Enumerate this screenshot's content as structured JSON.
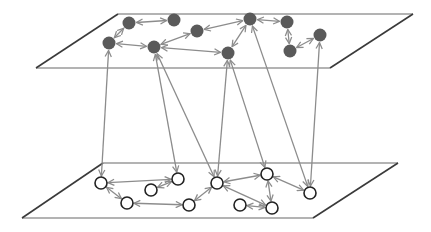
{
  "diagram": {
    "type": "multilayer-network",
    "colors": {
      "plane_edge": "#9a9a9a",
      "plane_diag": "#3a3a3a",
      "edge": "#8c8c8c",
      "top_node_fill": "#5a5a5a",
      "bottom_node_fill": "#ffffff",
      "bottom_node_stroke": "#222222"
    },
    "planes": [
      {
        "id": "top",
        "tl": [
          118,
          14
        ],
        "tr": [
          413,
          14
        ],
        "br": [
          330,
          68
        ],
        "bl": [
          36,
          68
        ]
      },
      {
        "id": "bottom",
        "tl": [
          103,
          163
        ],
        "tr": [
          398,
          163
        ],
        "br": [
          313,
          218
        ],
        "bl": [
          22,
          218
        ]
      }
    ],
    "top_nodes": [
      {
        "id": "T1",
        "x": 129,
        "y": 23
      },
      {
        "id": "T2",
        "x": 174,
        "y": 20
      },
      {
        "id": "T3",
        "x": 197,
        "y": 31
      },
      {
        "id": "T4",
        "x": 250,
        "y": 19
      },
      {
        "id": "T5",
        "x": 287,
        "y": 22
      },
      {
        "id": "T6",
        "x": 320,
        "y": 35
      },
      {
        "id": "T7",
        "x": 109,
        "y": 43
      },
      {
        "id": "T8",
        "x": 154,
        "y": 47
      },
      {
        "id": "T9",
        "x": 228,
        "y": 53
      },
      {
        "id": "T10",
        "x": 290,
        "y": 51
      }
    ],
    "bottom_nodes": [
      {
        "id": "B1",
        "x": 101,
        "y": 183
      },
      {
        "id": "B2",
        "x": 178,
        "y": 179
      },
      {
        "id": "B3",
        "x": 151,
        "y": 190
      },
      {
        "id": "B4",
        "x": 127,
        "y": 203
      },
      {
        "id": "B5",
        "x": 189,
        "y": 205
      },
      {
        "id": "B6",
        "x": 217,
        "y": 183
      },
      {
        "id": "B7",
        "x": 267,
        "y": 174
      },
      {
        "id": "B8",
        "x": 240,
        "y": 205
      },
      {
        "id": "B9",
        "x": 272,
        "y": 208
      },
      {
        "id": "B10",
        "x": 310,
        "y": 193
      }
    ],
    "edges": [
      [
        "T1",
        "T2"
      ],
      [
        "T1",
        "T7"
      ],
      [
        "T7",
        "T8"
      ],
      [
        "T8",
        "T3"
      ],
      [
        "T8",
        "T9"
      ],
      [
        "T3",
        "T4"
      ],
      [
        "T4",
        "T5"
      ],
      [
        "T4",
        "T9"
      ],
      [
        "T5",
        "T10"
      ],
      [
        "T10",
        "T6"
      ],
      [
        "B1",
        "B2"
      ],
      [
        "B1",
        "B4"
      ],
      [
        "B3",
        "B2"
      ],
      [
        "B4",
        "B5"
      ],
      [
        "B5",
        "B6"
      ],
      [
        "B6",
        "B7"
      ],
      [
        "B6",
        "B9"
      ],
      [
        "B7",
        "B9"
      ],
      [
        "B7",
        "B10"
      ],
      [
        "B8",
        "B9"
      ],
      [
        "T7",
        "B1"
      ],
      [
        "T8",
        "B2"
      ],
      [
        "T8",
        "B6"
      ],
      [
        "T9",
        "B6"
      ],
      [
        "T9",
        "B7"
      ],
      [
        "T4",
        "B10"
      ],
      [
        "T6",
        "B10"
      ]
    ]
  }
}
